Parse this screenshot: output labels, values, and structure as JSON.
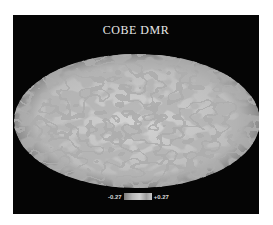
{
  "figure": {
    "title": "COBE DMR",
    "colorbar": {
      "min_label": "-0.27",
      "max_label": "+0.27"
    },
    "colors": {
      "background": "#050505",
      "map_light": "#c9c9c9",
      "map_dark": "#6e6e6e"
    }
  }
}
